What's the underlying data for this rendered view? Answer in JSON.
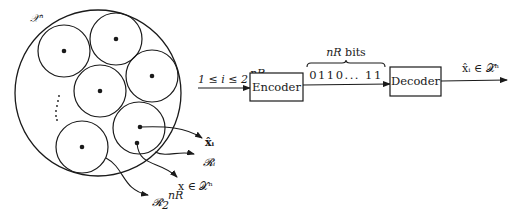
{
  "figure": {
    "space_label": "𝒳ⁿ",
    "continuation_dots": "⋮",
    "regions": [
      {
        "cx": 64,
        "cy": 51
      },
      {
        "cx": 116,
        "cy": 39
      },
      {
        "cx": 152,
        "cy": 76
      },
      {
        "cx": 100,
        "cy": 91
      },
      {
        "cx": 139,
        "cy": 128
      },
      {
        "cx": 82,
        "cy": 147
      }
    ],
    "annotations": {
      "codeword": "x̂ᵢ",
      "region_i": "𝓡ᵢ",
      "source_point": "x ∈ 𝒳ⁿ",
      "last_region_base": "𝓡",
      "last_region_sub": "2",
      "last_region_sup": "nR"
    }
  },
  "block_diagram": {
    "input_label_base": "1 ≤ i ≤ 2",
    "input_label_sup": "nR",
    "encoder_label": "Encoder",
    "bits_caption": "nR bits",
    "bit_string": "0110... 11",
    "decoder_label": "Decoder",
    "output_label": "x̂ᵢ ∈ 𝒳̂ⁿ"
  },
  "colors": {
    "stroke": "#1a1a1a",
    "background": "#ffffff"
  }
}
